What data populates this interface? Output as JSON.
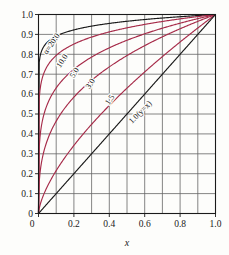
{
  "chart_data": {
    "type": "line",
    "title": "",
    "subtitle": "",
    "xlabel": "x",
    "ylabel": "",
    "xlim": [
      0.0,
      1.0
    ],
    "ylim": [
      0.0,
      1.0
    ],
    "grid": true,
    "grid_step_x": 0.1,
    "grid_step_y": 0.1,
    "legend_position": "inline-curve-labels",
    "x_tick_labels": [
      "0",
      "0.2",
      "0.4",
      "0.6",
      "0.8",
      "1.0"
    ],
    "x_tick_values": [
      0.0,
      0.2,
      0.4,
      0.6,
      0.8,
      1.0
    ],
    "y_tick_labels": [
      "0",
      "0.1",
      "0.2",
      "0.3",
      "0.4",
      "0.5",
      "0.6",
      "0.7",
      "0.8",
      "0.9",
      "1.0"
    ],
    "y_tick_values": [
      0.0,
      0.1,
      0.2,
      0.3,
      0.4,
      0.5,
      0.6,
      0.7,
      0.8,
      0.9,
      1.0
    ],
    "x": [
      0.0,
      0.02,
      0.05,
      0.1,
      0.15,
      0.2,
      0.3,
      0.4,
      0.5,
      0.6,
      0.7,
      0.8,
      0.9,
      1.0
    ],
    "series": [
      {
        "name": "alpha=20.0",
        "label": "α=20.0",
        "alpha": 20.0,
        "color": "#1a1a1a",
        "values": [
          0.0,
          0.8221,
          0.8609,
          0.8913,
          0.9095,
          0.9226,
          0.9417,
          0.9559,
          0.9659,
          0.9746,
          0.9824,
          0.989,
          0.9948,
          1.0
        ],
        "label_x": 0.085,
        "label_y": 0.845,
        "label_angle": -56
      },
      {
        "name": "alpha=10.0",
        "label": "10.0",
        "alpha": 10.0,
        "color": "#a62b49",
        "values": [
          0.0,
          0.676,
          0.7411,
          0.7943,
          0.8272,
          0.8513,
          0.887,
          0.9135,
          0.933,
          0.9502,
          0.9653,
          0.9786,
          0.9898,
          1.0
        ],
        "label_x": 0.145,
        "label_y": 0.76,
        "label_angle": -56
      },
      {
        "name": "alpha=5.0",
        "label": "5.0",
        "alpha": 5.0,
        "color": "#a62b49",
        "values": [
          0.0,
          0.4573,
          0.5493,
          0.631,
          0.6843,
          0.7248,
          0.7868,
          0.8325,
          0.8706,
          0.9029,
          0.9311,
          0.9564,
          0.9791,
          1.0
        ],
        "label_x": 0.215,
        "label_y": 0.7,
        "label_angle": -56
      },
      {
        "name": "alpha=3.0",
        "label": "3.0",
        "alpha": 3.0,
        "color": "#a62b49",
        "values": [
          0.0,
          0.2714,
          0.3684,
          0.4642,
          0.5313,
          0.5848,
          0.6694,
          0.7368,
          0.7937,
          0.8434,
          0.8879,
          0.9283,
          0.9655,
          1.0
        ],
        "label_x": 0.305,
        "label_y": 0.645,
        "label_angle": -56
      },
      {
        "name": "alpha=1.5",
        "label": "1.5",
        "alpha": 1.5,
        "color": "#a62b49",
        "values": [
          0.0,
          0.0737,
          0.1357,
          0.2154,
          0.2823,
          0.342,
          0.4481,
          0.5429,
          0.63,
          0.7114,
          0.7884,
          0.8618,
          0.9321,
          1.0
        ],
        "label_x": 0.415,
        "label_y": 0.565,
        "label_angle": -56
      },
      {
        "name": "alpha=1.0",
        "label": "1.0(y=x)",
        "alpha": 1.0,
        "color": "#1a1a1a",
        "values": [
          0.0,
          0.02,
          0.05,
          0.1,
          0.15,
          0.2,
          0.3,
          0.4,
          0.5,
          0.6,
          0.7,
          0.8,
          0.9,
          1.0
        ],
        "label_x": 0.585,
        "label_y": 0.5,
        "label_angle": -45
      }
    ],
    "colors": {
      "curve_black": "#1a1a1a",
      "curve_crimson": "#a62b49",
      "grid": "#666666",
      "axis": "#1a1a1a",
      "background": "#fdfdfb"
    }
  }
}
